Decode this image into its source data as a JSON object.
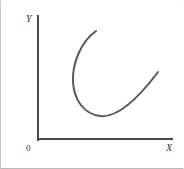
{
  "figure": {
    "title": "",
    "background_color": "#ffffff",
    "frame_border_color": "#c9c9c9"
  },
  "axes": {
    "y_label": "Y",
    "x_label": "X",
    "origin_label": "0",
    "axis_color": "#4a4a4a",
    "y_axis": {
      "x": 38,
      "y_top": 16,
      "y_bottom": 140
    },
    "x_axis": {
      "y": 139,
      "x_left": 38,
      "x_right": 172
    }
  },
  "curve": {
    "name": "u-shaped-curve",
    "color": "#575757",
    "stroke_width": 2,
    "path": "M 96 31 C 82 41, 72 62, 73 82 C 74 100, 84 114, 100 116 C 118 118, 140 96, 158 72",
    "description": "U-shaped (J-shaped) curve, like an average cost curve"
  },
  "chart_data": {
    "type": "line",
    "title": "",
    "xlabel": "X",
    "ylabel": "Y",
    "grid": false,
    "legend": null,
    "origin_label": "0",
    "axis_ranges": {
      "xlim": [
        0,
        1
      ],
      "ylim": [
        0,
        1
      ]
    },
    "series": [
      {
        "name": "u-shaped-curve",
        "color": "#575757",
        "x": [
          0.43,
          0.34,
          0.26,
          0.26,
          0.28,
          0.34,
          0.46,
          0.62,
          0.79,
          0.9
        ],
        "y": [
          0.87,
          0.79,
          0.62,
          0.47,
          0.34,
          0.25,
          0.19,
          0.27,
          0.43,
          0.55
        ]
      }
    ]
  }
}
